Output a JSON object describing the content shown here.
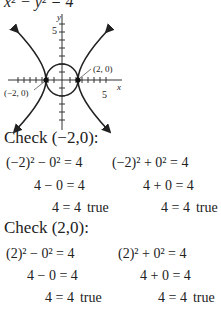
{
  "title_equation": "x² − y² = 4",
  "graph": {
    "y_axis_label": "y",
    "x_axis_label": "x",
    "y_tick_label": "5",
    "x_tick_label": "5",
    "point_right_label": "(2, 0)",
    "point_left_label": "(−2, 0)"
  },
  "check1": {
    "heading": "Check (−2,0):",
    "left": [
      "(−2)² − 0² = 4",
      "4 − 0 = 4",
      "4 = 4"
    ],
    "right": [
      "(−2)² + 0² = 4",
      "4 + 0 = 4",
      "4 = 4"
    ],
    "result": "true"
  },
  "check2": {
    "heading": "Check (2,0):",
    "left": [
      "(2)² − 0² = 4",
      "4 − 0 = 4",
      "4 = 4"
    ],
    "right": [
      "(2)² + 0² = 4",
      "4 + 0 = 4",
      "4 = 4"
    ],
    "result": "true"
  }
}
